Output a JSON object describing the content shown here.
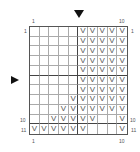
{
  "chart": {
    "cols": 10,
    "rows": 11,
    "symbol": "V",
    "top_labels": {
      "left": "1",
      "right": "10"
    },
    "bottom_labels": {
      "left": "1",
      "right": "10"
    },
    "left_labels": {
      "row1": "1",
      "row10": "10",
      "row11": "11"
    },
    "right_labels": {
      "row1": "1",
      "row10": "10",
      "row11": "11"
    },
    "grid": [
      [
        0,
        0,
        0,
        0,
        0,
        1,
        1,
        1,
        1,
        1
      ],
      [
        0,
        0,
        0,
        0,
        0,
        1,
        1,
        1,
        1,
        1
      ],
      [
        0,
        0,
        0,
        0,
        0,
        1,
        1,
        1,
        1,
        1
      ],
      [
        0,
        0,
        0,
        0,
        0,
        1,
        1,
        1,
        1,
        1
      ],
      [
        0,
        0,
        0,
        0,
        0,
        1,
        1,
        1,
        1,
        1
      ],
      [
        0,
        0,
        0,
        0,
        0,
        1,
        1,
        1,
        1,
        1
      ],
      [
        0,
        0,
        0,
        0,
        0,
        1,
        1,
        1,
        1,
        1
      ],
      [
        0,
        0,
        0,
        0,
        1,
        1,
        1,
        1,
        1,
        1
      ],
      [
        0,
        0,
        0,
        1,
        1,
        1,
        1,
        1,
        1,
        1
      ],
      [
        0,
        0,
        1,
        1,
        1,
        1,
        1,
        0,
        0,
        1
      ],
      [
        1,
        1,
        1,
        1,
        1,
        1,
        0,
        0,
        0,
        1
      ]
    ]
  }
}
